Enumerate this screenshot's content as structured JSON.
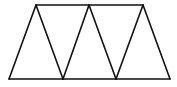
{
  "diagram": {
    "stroke_color": "#111111",
    "background": "#ffffff",
    "vertices": {
      "top": [
        [
          36,
          5
        ],
        [
          89,
          5
        ],
        [
          143,
          5
        ]
      ],
      "bottom": [
        [
          9,
          79
        ],
        [
          63,
          79
        ],
        [
          116,
          79
        ],
        [
          170,
          79
        ]
      ]
    },
    "segments": [
      {
        "name": "top-edge",
        "x1": 36,
        "y1": 5,
        "x2": 143,
        "y2": 5
      },
      {
        "name": "bottom-edge",
        "x1": 9,
        "y1": 79,
        "x2": 170,
        "y2": 79
      },
      {
        "name": "left-edge",
        "x1": 9,
        "y1": 79,
        "x2": 36,
        "y2": 5
      },
      {
        "name": "diag-1",
        "x1": 36,
        "y1": 5,
        "x2": 63,
        "y2": 79
      },
      {
        "name": "diag-2",
        "x1": 63,
        "y1": 79,
        "x2": 89,
        "y2": 5
      },
      {
        "name": "diag-3",
        "x1": 89,
        "y1": 5,
        "x2": 116,
        "y2": 79
      },
      {
        "name": "diag-4",
        "x1": 116,
        "y1": 79,
        "x2": 143,
        "y2": 5
      },
      {
        "name": "right-edge",
        "x1": 143,
        "y1": 5,
        "x2": 170,
        "y2": 79
      }
    ]
  }
}
